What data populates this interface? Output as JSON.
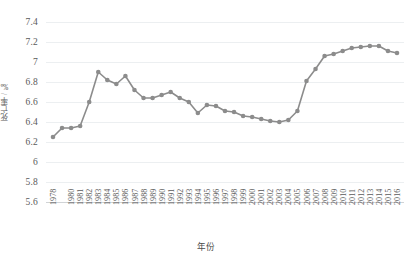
{
  "chart_data": {
    "type": "line",
    "title": "",
    "xlabel": "年份",
    "ylabel": "死亡率 / ‰",
    "ylim": [
      5.6,
      7.4
    ],
    "yticks": [
      5.6,
      5.8,
      6,
      6.2,
      6.4,
      6.6,
      6.8,
      7,
      7.2,
      7.4
    ],
    "ytick_labels": [
      "5.6",
      "5.8",
      "6",
      "6.2",
      "6.4",
      "6.6",
      "6.8",
      "7",
      "7.2",
      "7.4"
    ],
    "grid": true,
    "legend": "none",
    "series_color": "#8c8c8c",
    "marker": "circle",
    "x": [
      1978,
      1979,
      1980,
      1981,
      1982,
      1983,
      1984,
      1985,
      1986,
      1987,
      1988,
      1989,
      1990,
      1991,
      1992,
      1993,
      1994,
      1995,
      1996,
      1997,
      1998,
      1999,
      2000,
      2001,
      2002,
      2003,
      2004,
      2005,
      2006,
      2007,
      2008,
      2009,
      2010,
      2011,
      2012,
      2013,
      2014,
      2015,
      2016
    ],
    "xtick_labels": [
      "1978",
      "1980",
      "1981",
      "1982",
      "1983",
      "1984",
      "1985",
      "1986",
      "1987",
      "1988",
      "1989",
      "1990",
      "1991",
      "1992",
      "1993",
      "1994",
      "1995",
      "1996",
      "1997",
      "1998",
      "1999",
      "2000",
      "2001",
      "2002",
      "2003",
      "2004",
      "2005",
      "2006",
      "2007",
      "2008",
      "2009",
      "2010",
      "2011",
      "2012",
      "2013",
      "2014",
      "2015",
      "2016"
    ],
    "xtick_values": [
      1978,
      1980,
      1981,
      1982,
      1983,
      1984,
      1985,
      1986,
      1987,
      1988,
      1989,
      1990,
      1991,
      1992,
      1993,
      1994,
      1995,
      1996,
      1997,
      1998,
      1999,
      2000,
      2001,
      2002,
      2003,
      2004,
      2005,
      2006,
      2007,
      2008,
      2009,
      2010,
      2011,
      2012,
      2013,
      2014,
      2015,
      2016
    ],
    "values": [
      6.25,
      6.34,
      6.34,
      6.36,
      6.6,
      6.9,
      6.82,
      6.78,
      6.86,
      6.72,
      6.64,
      6.64,
      6.67,
      6.7,
      6.64,
      6.6,
      6.49,
      6.57,
      6.56,
      6.51,
      6.5,
      6.46,
      6.45,
      6.43,
      6.41,
      6.4,
      6.42,
      6.51,
      6.81,
      6.93,
      7.06,
      7.08,
      7.11,
      7.14,
      7.15,
      7.16,
      7.16,
      7.11,
      7.09
    ],
    "series_name": "死亡率"
  }
}
